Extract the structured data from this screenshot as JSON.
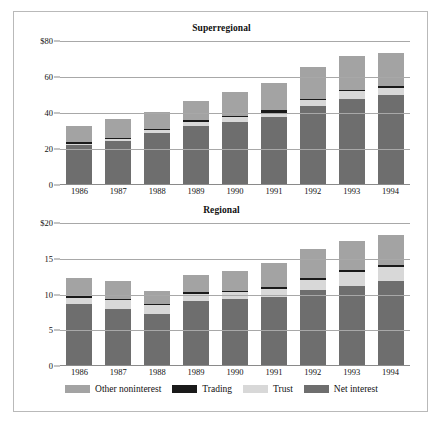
{
  "figure": {
    "background": "#ffffff",
    "border_color": "#b9b9b9"
  },
  "legend": {
    "items": [
      {
        "label": "Other noninterest",
        "color": "#a3a3a3",
        "key": "other"
      },
      {
        "label": "Trading",
        "color": "#1a1a1a",
        "key": "trading"
      },
      {
        "label": "Trust",
        "color": "#d8d8d8",
        "key": "trust"
      },
      {
        "label": "Net interest",
        "color": "#6e6e6e",
        "key": "net"
      }
    ]
  },
  "chart_data": [
    {
      "type": "bar",
      "subtype": "stacked",
      "title": "Superregional",
      "xlabel": "",
      "ylabel": "",
      "ylim": [
        0,
        80
      ],
      "yticks": [
        0,
        20,
        40,
        60,
        80
      ],
      "ytick_labels": [
        "0",
        "20",
        "40",
        "60",
        "$80"
      ],
      "grid": true,
      "legend_position": "bottom",
      "categories": [
        "1986",
        "1987",
        "1988",
        "1989",
        "1990",
        "1991",
        "1992",
        "1993",
        "1994"
      ],
      "series": [
        {
          "name": "Net interest",
          "color": "#6e6e6e",
          "values": [
            21.5,
            23.8,
            28.5,
            32.5,
            34.5,
            37.0,
            43.5,
            47.0,
            49.5
          ]
        },
        {
          "name": "Trust",
          "color": "#d8d8d8",
          "values": [
            1.0,
            1.2,
            1.5,
            2.0,
            2.5,
            2.5,
            3.0,
            4.5,
            4.0
          ]
        },
        {
          "name": "Trading",
          "color": "#1a1a1a",
          "values": [
            0.6,
            0.7,
            0.7,
            0.8,
            0.9,
            1.5,
            1.0,
            1.0,
            1.2
          ]
        },
        {
          "name": "Other noninterest",
          "color": "#a3a3a3",
          "values": [
            9.4,
            10.3,
            9.3,
            10.7,
            13.1,
            15.0,
            17.5,
            18.5,
            18.3
          ]
        }
      ],
      "totals": [
        32.5,
        36.0,
        40.0,
        46.0,
        51.0,
        56.0,
        65.0,
        71.0,
        73.0
      ]
    },
    {
      "type": "bar",
      "subtype": "stacked",
      "title": "Regional",
      "xlabel": "",
      "ylabel": "",
      "ylim": [
        0,
        20
      ],
      "yticks": [
        0,
        5,
        10,
        15,
        20
      ],
      "ytick_labels": [
        "0",
        "5",
        "10",
        "15",
        "$20"
      ],
      "grid": true,
      "legend_position": "bottom",
      "categories": [
        "1986",
        "1987",
        "1988",
        "1989",
        "1990",
        "1991",
        "1992",
        "1993",
        "1994"
      ],
      "series": [
        {
          "name": "Net interest",
          "color": "#6e6e6e",
          "values": [
            8.5,
            7.9,
            7.2,
            8.9,
            9.2,
            9.5,
            10.5,
            11.1,
            11.7
          ]
        },
        {
          "name": "Trust",
          "color": "#d8d8d8",
          "values": [
            0.9,
            1.2,
            1.2,
            1.1,
            1.0,
            1.2,
            1.4,
            1.9,
            2.0
          ]
        },
        {
          "name": "Trading",
          "color": "#1a1a1a",
          "values": [
            0.2,
            0.2,
            0.2,
            0.2,
            0.2,
            0.2,
            0.3,
            0.3,
            0.3
          ]
        },
        {
          "name": "Other noninterest",
          "color": "#a3a3a3",
          "values": [
            2.6,
            2.4,
            1.8,
            2.4,
            2.8,
            3.4,
            4.0,
            4.0,
            4.2
          ]
        }
      ],
      "totals": [
        12.2,
        11.7,
        10.4,
        12.6,
        13.2,
        14.3,
        16.2,
        17.3,
        18.2
      ]
    }
  ]
}
